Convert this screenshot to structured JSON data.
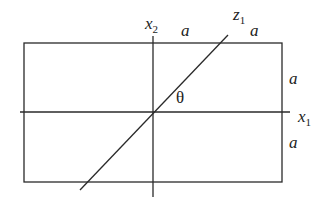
{
  "diagram": {
    "type": "geometry-figure",
    "rectangle": {
      "x": 24,
      "y": 43,
      "width": 258,
      "height": 139
    },
    "axes": {
      "x1": {
        "x1": 20,
        "y1": 112,
        "x2": 290,
        "y2": 112,
        "label": "x",
        "subscript": "1"
      },
      "x2": {
        "x1": 153,
        "y1": 36,
        "x2": 153,
        "y2": 197,
        "label": "x",
        "subscript": "2"
      },
      "z1": {
        "x1": 80,
        "y1": 190,
        "x2": 228,
        "y2": 35,
        "label": "z",
        "subscript": "1"
      }
    },
    "angle_label": "θ",
    "dimension_labels": [
      {
        "id": "top-left-a",
        "text": "a"
      },
      {
        "id": "top-right-a",
        "text": "a"
      },
      {
        "id": "right-upper-a",
        "text": "a"
      },
      {
        "id": "right-lower-a",
        "text": "a"
      }
    ],
    "stroke_color": "#2a2a2a",
    "background": "#ffffff"
  }
}
